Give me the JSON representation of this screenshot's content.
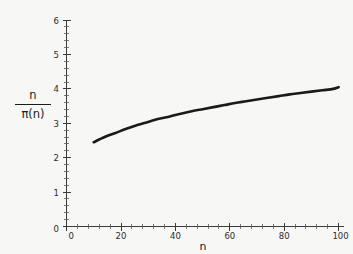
{
  "figure": {
    "background_color": "#f7f7f5",
    "curve_color": "#1a1a1a",
    "axis_color": "#3a3a3a"
  },
  "axes": {
    "x_label": "n",
    "y_label_numerator": "n",
    "y_label_denominator": "π(n)",
    "x_ticks": [
      "0",
      "20",
      "40",
      "60",
      "80",
      "100"
    ],
    "y_ticks": [
      "0",
      "1",
      "2",
      "3",
      "4",
      "5",
      "6"
    ],
    "x_zero_label": "0",
    "y_zero_label": "0"
  },
  "chart_data": {
    "type": "line",
    "title": "",
    "xlabel": "n",
    "ylabel": "n / π(n)",
    "xlim": [
      0,
      100
    ],
    "ylim": [
      0,
      6
    ],
    "grid": false,
    "legend": null,
    "x_tick_values": [
      0,
      20,
      40,
      60,
      80,
      100
    ],
    "y_tick_values": [
      0,
      1,
      2,
      3,
      4,
      5,
      6
    ],
    "x_minor_tick_step": 4,
    "y_minor_tick_step": 0.2,
    "series": [
      {
        "name": "n / π(n)",
        "x": [
          10,
          14,
          18,
          22,
          26,
          30,
          34,
          38,
          42,
          46,
          50,
          54,
          58,
          62,
          66,
          70,
          74,
          78,
          82,
          86,
          90,
          94,
          98,
          100
        ],
        "values": [
          2.45,
          2.6,
          2.72,
          2.84,
          2.95,
          3.04,
          3.13,
          3.2,
          3.28,
          3.35,
          3.41,
          3.47,
          3.53,
          3.59,
          3.64,
          3.69,
          3.74,
          3.79,
          3.84,
          3.88,
          3.92,
          3.96,
          4.0,
          4.05
        ]
      }
    ]
  }
}
